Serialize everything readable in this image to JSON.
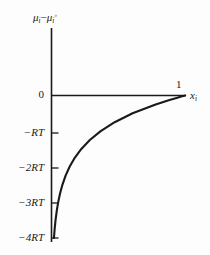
{
  "figure": {
    "background_color": "#fdfdfd",
    "line_color": "#1a1a1a",
    "axis_color": "#1a1a1a"
  },
  "axes": {
    "y_axis_label_parts": {
      "mu1": "μ",
      "sub1": "i",
      "minus": "−",
      "mu2": "μ",
      "sub2": "i",
      "sup2": "◦"
    },
    "y_axis_label_text": "μi − μi◦",
    "x_axis_label_parts": {
      "x": "x",
      "sub": "i"
    },
    "x_axis_label_text": "xi",
    "x_tick_label": "1"
  },
  "chart_data": {
    "type": "line",
    "title": "",
    "subtitle": "",
    "xlabel": "xi",
    "ylabel": "μi − μi◦",
    "grid": false,
    "legend": "none",
    "xlim": [
      0,
      1
    ],
    "ylim": [
      -4,
      0
    ],
    "x_ticks": [
      1
    ],
    "x_tick_labels": [
      "1"
    ],
    "y_ticks": [
      0,
      -1,
      -2,
      -3,
      -4
    ],
    "y_tick_labels": [
      "0",
      "−RT",
      "−2RT",
      "−3RT",
      "−4RT"
    ],
    "y_unit": "RT",
    "series": [
      {
        "name": "μi − μi◦ = RT ln xi",
        "x": [
          0.0183,
          0.0235,
          0.0302,
          0.0388,
          0.0498,
          0.0639,
          0.0821,
          0.1054,
          0.1353,
          0.1738,
          0.2231,
          0.2865,
          0.3679,
          0.4724,
          0.6065,
          0.7788,
          0.8825,
          0.9418,
          0.9704,
          1.0
        ],
        "y": [
          -4.0,
          -3.75,
          -3.5,
          -3.25,
          -3.0,
          -2.75,
          -2.5,
          -2.25,
          -2.0,
          -1.75,
          -1.5,
          -1.25,
          -1.0,
          -0.75,
          -0.5,
          -0.25,
          -0.125,
          -0.06,
          -0.03,
          0.0
        ]
      }
    ]
  },
  "labels": {
    "y_ticks": [
      {
        "text": "0",
        "value": 0
      },
      {
        "text": "−RT",
        "value": -1
      },
      {
        "text": "−2RT",
        "value": -2
      },
      {
        "text": "−3RT",
        "value": -3
      },
      {
        "text": "−4RT",
        "value": -4
      }
    ]
  }
}
